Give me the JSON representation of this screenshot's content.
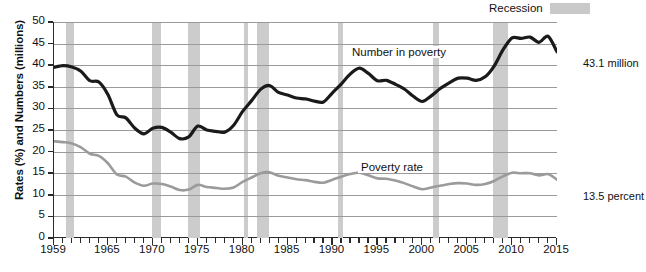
{
  "legend": {
    "recession_label": "Recession",
    "recession_color": "#cccccc"
  },
  "axes": {
    "ylabel": "Rates (%) and Numbers (millions)",
    "yticks": [
      "0",
      "5",
      "10",
      "15",
      "20",
      "25",
      "30",
      "35",
      "40",
      "45",
      "50"
    ],
    "xticks": [
      "1959",
      "1965",
      "1970",
      "1975",
      "1980",
      "1985",
      "1990",
      "1995",
      "2000",
      "2005",
      "2010",
      "2015"
    ]
  },
  "annotations": {
    "number_in_poverty": "Number in poverty",
    "poverty_rate": "Poverty rate",
    "end_number": "43.1 million",
    "end_rate": "13.5 percent"
  },
  "chart_data": {
    "type": "line",
    "title": "",
    "xlabel": "",
    "ylabel": "Rates (%) and Numbers (millions)",
    "xlim": [
      1959,
      2015
    ],
    "ylim": [
      0,
      50
    ],
    "grid": true,
    "legend_position": "top-right",
    "x": [
      1959,
      1960,
      1961,
      1962,
      1963,
      1964,
      1965,
      1966,
      1967,
      1968,
      1969,
      1970,
      1971,
      1972,
      1973,
      1974,
      1975,
      1976,
      1977,
      1978,
      1979,
      1980,
      1981,
      1982,
      1983,
      1984,
      1985,
      1986,
      1987,
      1988,
      1989,
      1990,
      1991,
      1992,
      1993,
      1994,
      1995,
      1996,
      1997,
      1998,
      1999,
      2000,
      2001,
      2002,
      2003,
      2004,
      2005,
      2006,
      2007,
      2008,
      2009,
      2010,
      2011,
      2012,
      2013,
      2014,
      2015
    ],
    "series": [
      {
        "name": "Number in poverty",
        "units": "millions",
        "color": "#1a1a1a",
        "values": [
          39.5,
          39.9,
          39.6,
          38.6,
          36.4,
          36.1,
          33.2,
          28.5,
          27.8,
          25.4,
          24.1,
          25.4,
          25.6,
          24.5,
          23.0,
          23.4,
          25.9,
          25.0,
          24.7,
          24.5,
          26.1,
          29.3,
          31.8,
          34.4,
          35.3,
          33.7,
          33.1,
          32.4,
          32.2,
          31.7,
          31.5,
          33.6,
          35.7,
          38.0,
          39.3,
          38.1,
          36.4,
          36.5,
          35.6,
          34.5,
          32.8,
          31.6,
          32.9,
          34.6,
          35.9,
          37.0,
          37.0,
          36.5,
          37.3,
          39.8,
          43.6,
          46.3,
          46.2,
          46.5,
          45.3,
          46.7,
          43.1
        ]
      },
      {
        "name": "Poverty rate",
        "units": "percent",
        "color": "#9b9b9b",
        "values": [
          22.4,
          22.2,
          21.9,
          21.0,
          19.5,
          19.0,
          17.3,
          14.7,
          14.2,
          12.8,
          12.1,
          12.6,
          12.5,
          11.9,
          11.1,
          11.2,
          12.3,
          11.8,
          11.6,
          11.4,
          11.7,
          13.0,
          14.0,
          15.0,
          15.2,
          14.4,
          14.0,
          13.6,
          13.4,
          13.0,
          12.8,
          13.5,
          14.2,
          14.8,
          15.1,
          14.5,
          13.8,
          13.7,
          13.3,
          12.7,
          11.9,
          11.3,
          11.7,
          12.1,
          12.5,
          12.7,
          12.6,
          12.3,
          12.5,
          13.2,
          14.3,
          15.1,
          15.0,
          15.0,
          14.5,
          14.8,
          13.5
        ]
      }
    ],
    "recession_bands": [
      {
        "start": 1960.3,
        "end": 1961.2
      },
      {
        "start": 1969.9,
        "end": 1970.9
      },
      {
        "start": 1973.9,
        "end": 1975.2
      },
      {
        "start": 1980.1,
        "end": 1980.6
      },
      {
        "start": 1981.6,
        "end": 1982.9
      },
      {
        "start": 1990.6,
        "end": 1991.2
      },
      {
        "start": 2001.2,
        "end": 2001.9
      },
      {
        "start": 2007.9,
        "end": 2009.5
      }
    ],
    "end_labels": {
      "number_in_poverty": "43.1 million",
      "poverty_rate": "13.5 percent"
    }
  }
}
